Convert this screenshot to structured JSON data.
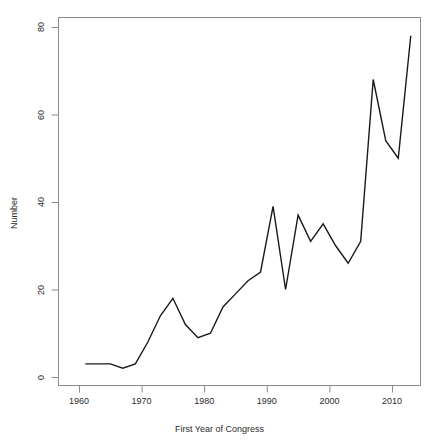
{
  "chart_data": {
    "type": "line",
    "title": "",
    "xlabel": "First Year of Congress",
    "ylabel": "Number",
    "xlim": [
      1955,
      2016
    ],
    "ylim": [
      0,
      84
    ],
    "grid": false,
    "legend": null,
    "x_ticks": [
      1960,
      1970,
      1980,
      1990,
      2000,
      2010
    ],
    "y_ticks": [
      0,
      20,
      40,
      60,
      80
    ],
    "x": [
      1961,
      1963,
      1965,
      1967,
      1969,
      1971,
      1973,
      1975,
      1977,
      1979,
      1981,
      1983,
      1985,
      1987,
      1989,
      1991,
      1993,
      1995,
      1997,
      1999,
      2001,
      2003,
      2005,
      2007,
      2009,
      2011,
      2013
    ],
    "values": [
      3,
      3,
      3,
      2,
      3,
      8,
      14,
      18,
      12,
      9,
      10,
      16,
      19,
      22,
      24,
      39,
      20,
      37,
      31,
      35,
      30,
      26,
      31,
      68,
      54,
      50,
      78
    ],
    "series": [
      {
        "name": "Number",
        "color": "#1a1a1a",
        "values": [
          3,
          3,
          3,
          2,
          3,
          8,
          14,
          18,
          12,
          9,
          10,
          16,
          19,
          22,
          24,
          39,
          20,
          37,
          31,
          35,
          30,
          26,
          31,
          68,
          54,
          50,
          78
        ]
      }
    ]
  },
  "axes": {
    "y_tick_labels": [
      "0",
      "20",
      "40",
      "60",
      "80"
    ],
    "x_tick_labels": [
      "1960",
      "1970",
      "1980",
      "1990",
      "2000",
      "2010"
    ],
    "y_title": "Number",
    "x_title": "First Year of Congress"
  },
  "title": ""
}
